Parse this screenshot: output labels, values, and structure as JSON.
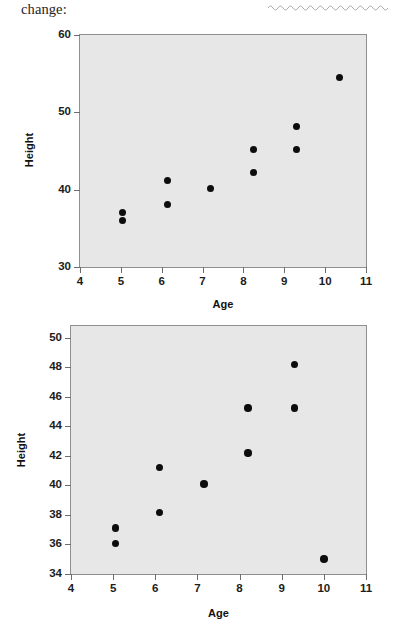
{
  "page": {
    "header_text": "change:",
    "redaction_mark": "wavy-underline"
  },
  "colors": {
    "plot_background": "#e7e7e7",
    "plot_border": "#8f8f8f",
    "dot": "#0d0d0d",
    "tick": "#6d6d6d",
    "text": "#1c1c1c"
  },
  "chart_data": [
    {
      "id": "scatter-top",
      "type": "scatter",
      "title": "",
      "xlabel": "Age",
      "ylabel": "Height",
      "xlim": [
        4,
        11
      ],
      "ylim": [
        30,
        60
      ],
      "xticks": [
        4,
        5,
        6,
        7,
        8,
        9,
        10,
        11
      ],
      "yticks": [
        30,
        40,
        50,
        60
      ],
      "grid": false,
      "legend": "none",
      "points": [
        {
          "x": 5.05,
          "y": 37.1
        },
        {
          "x": 5.05,
          "y": 36.0
        },
        {
          "x": 6.15,
          "y": 41.2
        },
        {
          "x": 6.15,
          "y": 38.1
        },
        {
          "x": 7.2,
          "y": 40.1
        },
        {
          "x": 8.25,
          "y": 45.2
        },
        {
          "x": 8.25,
          "y": 42.2
        },
        {
          "x": 9.3,
          "y": 48.2
        },
        {
          "x": 9.3,
          "y": 45.2
        },
        {
          "x": 10.35,
          "y": 54.5
        }
      ]
    },
    {
      "id": "scatter-bottom",
      "type": "scatter",
      "title": "",
      "xlabel": "Age",
      "ylabel": "Height",
      "xlim": [
        4,
        11
      ],
      "ylim": [
        34,
        50.8
      ],
      "xticks": [
        4,
        5,
        6,
        7,
        8,
        9,
        10,
        11
      ],
      "yticks": [
        34,
        36,
        38,
        40,
        42,
        44,
        46,
        48,
        50
      ],
      "grid": false,
      "legend": "none",
      "points": [
        {
          "x": 5.05,
          "y": 37.1
        },
        {
          "x": 5.05,
          "y": 36.05
        },
        {
          "x": 6.1,
          "y": 41.2
        },
        {
          "x": 6.1,
          "y": 38.15
        },
        {
          "x": 7.15,
          "y": 40.1
        },
        {
          "x": 8.2,
          "y": 45.25
        },
        {
          "x": 8.2,
          "y": 42.2
        },
        {
          "x": 9.3,
          "y": 48.2
        },
        {
          "x": 9.3,
          "y": 45.25
        },
        {
          "x": 10.0,
          "y": 35.0
        }
      ]
    }
  ]
}
